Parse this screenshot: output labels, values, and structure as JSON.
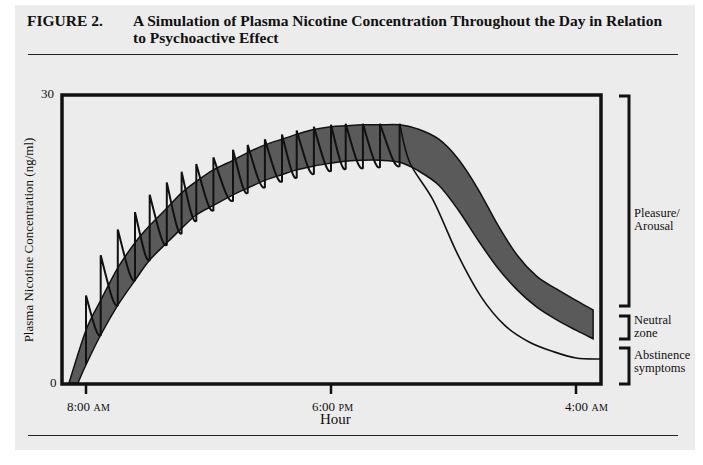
{
  "figure": {
    "label": "FIGURE 2.",
    "title": "A Simulation of Plasma Nicotine Concentration Throughout the Day in Relation to Psychoactive Effect"
  },
  "colors": {
    "panel_bg": "#ececec",
    "band_fill": "#5a5a5a",
    "line": "#111111"
  },
  "chart_data": {
    "type": "area",
    "title": "A Simulation of Plasma Nicotine Concentration Throughout the Day in Relation to Psychoactive Effect",
    "xlabel": "Hour",
    "ylabel": "Plasma Nicotine Concentration (ng/ml)",
    "ylim": [
      0,
      30
    ],
    "y_ticks": [
      "0",
      "30"
    ],
    "x_ticks": [
      {
        "label": "8:00",
        "suffix": "AM",
        "hours_from_start": 0
      },
      {
        "label": "6:00",
        "suffix": "PM",
        "hours_from_start": 10
      },
      {
        "label": "4:00",
        "suffix": "AM",
        "hours_from_start": 20
      }
    ],
    "grid": false,
    "x_hours": [
      -0.7,
      0,
      0.6,
      1.3,
      2.0,
      2.6,
      3.3,
      3.9,
      4.5,
      5.2,
      6.0,
      6.6,
      7.3,
      8.0,
      8.6,
      9.3,
      10.0,
      10.6,
      11.3,
      12.0,
      12.8,
      13.5,
      14.4,
      15.2,
      16.0,
      16.8,
      17.6,
      18.4,
      19.2,
      20.0,
      20.7
    ],
    "series": [
      {
        "name": "Neutral-zone band upper bound (ng/ml)",
        "values": [
          0,
          5.5,
          8.6,
          12.0,
          14.6,
          16.4,
          18.2,
          19.8,
          21.0,
          22.2,
          23.2,
          24.0,
          24.8,
          25.4,
          25.9,
          26.4,
          26.7,
          26.8,
          26.9,
          26.9,
          26.9,
          26.5,
          25.4,
          23.3,
          20.2,
          16.5,
          13.3,
          11.1,
          9.8,
          8.6,
          7.6
        ]
      },
      {
        "name": "Neutral-zone band lower bound (ng/ml)",
        "values": [
          0,
          1.9,
          5.0,
          8.1,
          10.7,
          12.8,
          14.6,
          16.1,
          17.5,
          18.5,
          19.6,
          20.3,
          21.1,
          21.7,
          22.2,
          22.6,
          22.9,
          23.1,
          23.2,
          23.2,
          23.0,
          22.2,
          20.6,
          18.0,
          14.9,
          12.0,
          9.7,
          7.9,
          6.6,
          5.5,
          4.6
        ]
      },
      {
        "name": "Plasma nicotine after last cigarette (ng/ml)",
        "decay_values": [
          23.0,
          19.0,
          13.5,
          9.0,
          6.0,
          4.3,
          3.3,
          2.6,
          2.5
        ]
      }
    ],
    "cigarette_peaks": {
      "count": 20,
      "x_hours": [
        0,
        0.6,
        1.3,
        2.0,
        2.6,
        3.3,
        3.9,
        4.5,
        5.2,
        6.0,
        6.6,
        7.3,
        8.0,
        8.6,
        9.3,
        10.0,
        10.6,
        11.3,
        12.0,
        12.8
      ],
      "peak_values": [
        9.1,
        13.3,
        16.0,
        17.8,
        19.6,
        20.9,
        22.0,
        22.8,
        23.5,
        24.3,
        24.8,
        25.4,
        25.9,
        26.3,
        26.7,
        26.9,
        27.0,
        27.0,
        27.0,
        27.0
      ],
      "trough_values": [
        1.9,
        5.0,
        8.1,
        10.7,
        12.8,
        14.4,
        15.6,
        16.9,
        18.0,
        19.0,
        19.8,
        20.4,
        21.0,
        21.4,
        21.8,
        22.1,
        22.3,
        22.4,
        22.5,
        22.6
      ]
    },
    "zones": [
      {
        "name": "Pleasure/ Arousal",
        "range_ng_ml": [
          8.0,
          30
        ]
      },
      {
        "name": "Neutral zone",
        "range_ng_ml": [
          4.5,
          7.5
        ]
      },
      {
        "name": "Abstinence symptoms",
        "range_ng_ml": [
          0,
          4.0
        ]
      }
    ]
  },
  "axes": {
    "ylabel": "Plasma Nicotine Concentration (ng/ml)",
    "ytick_top": "30",
    "ytick_bottom": "0",
    "xlabel": "Hour",
    "xticks": [
      {
        "time": "8:00",
        "period": "AM"
      },
      {
        "time": "6:00",
        "period": "PM"
      },
      {
        "time": "4:00",
        "period": "AM"
      }
    ]
  },
  "zones": {
    "pleasure_line1": "Pleasure/",
    "pleasure_line2": "Arousal",
    "neutral_line1": "Neutral",
    "neutral_line2": "zone",
    "abstinence_line1": "Abstinence",
    "abstinence_line2": "symptoms"
  }
}
